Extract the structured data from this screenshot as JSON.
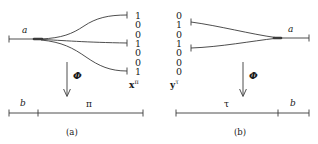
{
  "figure": {
    "panels": [
      {
        "id": "a",
        "caption": "(a)",
        "node_label": "a",
        "map_label": "Φ",
        "vector_name_bold": "x",
        "vector_name_sup": "π",
        "bitstring": [
          "1",
          "0",
          "0",
          "1",
          "0",
          "0",
          "1"
        ],
        "branch_rows": [
          0,
          3,
          6
        ],
        "axis_segments": [
          {
            "label": "b",
            "italic": true
          },
          {
            "label": "π",
            "italic": false
          }
        ]
      },
      {
        "id": "b",
        "caption": "(b)",
        "node_label": "a",
        "map_label": "Φ",
        "vector_name_bold": "y",
        "vector_name_sup": "τ",
        "bitstring": [
          "0",
          "1",
          "0",
          "1",
          "0",
          "0",
          "0"
        ],
        "branch_rows": [
          1,
          3
        ],
        "axis_segments": [
          {
            "label": "τ",
            "italic": false
          },
          {
            "label": "b",
            "italic": true
          }
        ]
      }
    ],
    "colors": {
      "ink": "#1a1a1a",
      "line": "#3a3a3a",
      "background": "#ffffff"
    }
  }
}
